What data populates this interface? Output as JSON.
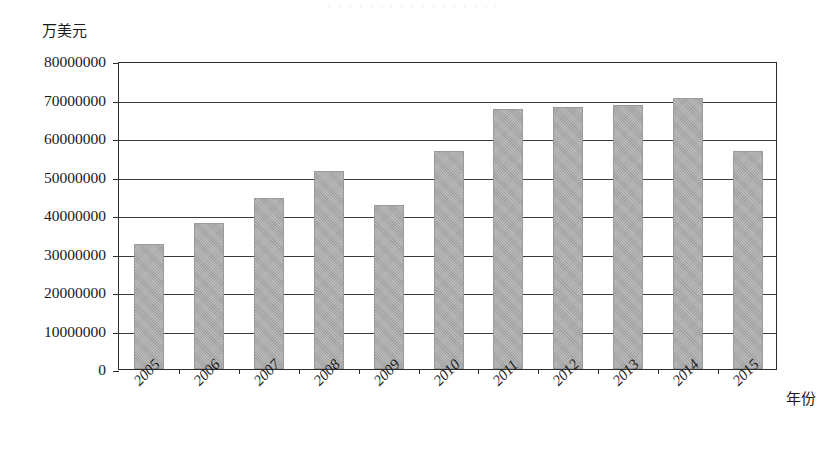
{
  "figure": {
    "top_clipped_text": "· · · · · · · · · · · · · · · · ·",
    "y_unit_label": "万美元",
    "x_axis_title": "年份"
  },
  "chart_data": {
    "type": "bar",
    "title": "",
    "subtitle": "",
    "xlabel": "年份",
    "ylabel": "万美元",
    "categories": [
      "2005",
      "2006",
      "2007",
      "2008",
      "2009",
      "2010",
      "2011",
      "2012",
      "2013",
      "2014",
      "2015"
    ],
    "values": [
      32500000,
      38000000,
      44500000,
      51500000,
      42500000,
      56500000,
      67500000,
      68000000,
      68500000,
      70500000,
      56500000
    ],
    "ylim": [
      0,
      80000000
    ],
    "ytick_values": [
      0,
      10000000,
      20000000,
      30000000,
      40000000,
      50000000,
      60000000,
      70000000,
      80000000
    ],
    "ytick_labels": [
      "0",
      "10000000",
      "20000000",
      "30000000",
      "40000000",
      "50000000",
      "60000000",
      "70000000",
      "80000000"
    ],
    "grid": "horizontal",
    "legend": "none",
    "bar_color": "#a9a9a9",
    "axis_color": "#2b2b2b",
    "series": [
      {
        "name": "",
        "values": [
          32500000,
          38000000,
          44500000,
          51500000,
          42500000,
          56500000,
          67500000,
          68000000,
          68500000,
          70500000,
          56500000
        ]
      }
    ]
  }
}
